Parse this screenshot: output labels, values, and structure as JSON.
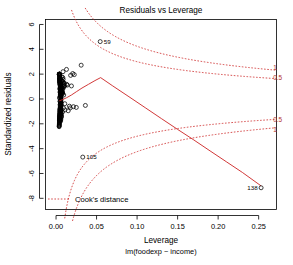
{
  "chart_data": {
    "type": "scatter",
    "title": "Residuals vs Leverage",
    "xlabel": "Leverage",
    "xsublabel": "lm(foodexp ~ income)",
    "ylabel": "Standardized residuals",
    "xlim": [
      -0.013,
      0.272
    ],
    "ylim": [
      -8.9,
      6.4
    ],
    "xticks": [
      "0.00",
      "0.05",
      "0.10",
      "0.15",
      "0.20",
      "0.25"
    ],
    "xtick_values": [
      0.0,
      0.05,
      0.1,
      0.15,
      0.2,
      0.25
    ],
    "yticks": [
      "6",
      "4",
      "2",
      "0",
      "-2",
      "-4",
      "-6",
      "-8"
    ],
    "ytick_values": [
      6,
      4,
      2,
      0,
      -2,
      -4,
      -6,
      -8
    ],
    "grid": false,
    "legend_position": "bottom-left",
    "point_marker": "open-circle",
    "series": [
      {
        "name": "observations",
        "x": [
          0.0362,
          0.0051,
          0.0079,
          0.0063,
          0.0057,
          0.0055,
          0.0129,
          0.0206,
          0.0046,
          0.008,
          0.031,
          0.0053,
          0.018,
          0.0092,
          0.0043,
          0.0058,
          0.0061,
          0.0049,
          0.0072,
          0.0225,
          0.0047,
          0.0054,
          0.0066,
          0.01,
          0.0042,
          0.0059,
          0.0086,
          0.0048,
          0.0051,
          0.014,
          0.0044,
          0.0063,
          0.0075,
          0.0052,
          0.0046,
          0.019,
          0.0057,
          0.0049,
          0.0068,
          0.0111,
          0.0044,
          0.006,
          0.0082,
          0.0047,
          0.0053,
          0.025,
          0.0045,
          0.0064,
          0.0071,
          0.0095,
          0.0043,
          0.0056,
          0.0088,
          0.005,
          0.0055,
          0.0165,
          0.0046,
          0.0062,
          0.0078,
          0.0105,
          0.0042,
          0.0058,
          0.0084,
          0.0051,
          0.0054,
          0.0215,
          0.0047,
          0.0065,
          0.0074,
          0.0098,
          0.0044,
          0.0057,
          0.009,
          0.0049,
          0.0052,
          0.015,
          0.0045,
          0.0061,
          0.0077,
          0.0102,
          0.0043,
          0.0059,
          0.0085,
          0.0048,
          0.0056,
          0.0175,
          0.0046,
          0.0063,
          0.0073,
          0.0093,
          0.0042,
          0.006,
          0.0087,
          0.005,
          0.0053,
          0.013,
          0.0047,
          0.0066,
          0.0076,
          0.0108
        ],
        "y": [
          -0.52,
          1.15,
          0.42,
          -1.3,
          0.88,
          -0.35,
          2.38,
          2.05,
          1.62,
          -1.05,
          2.72,
          0.25,
          1.9,
          -0.72,
          1.42,
          -1.58,
          0.62,
          -0.18,
          1.78,
          1.96,
          -0.92,
          0.35,
          -1.42,
          1.25,
          0.08,
          -1.68,
          2.2,
          0.55,
          -0.65,
          1.12,
          1.35,
          -1.22,
          0.72,
          -0.42,
          1.52,
          1.05,
          -1.78,
          0.18,
          0.95,
          -0.88,
          1.68,
          -0.28,
          0.48,
          -1.5,
          1.22,
          -0.68,
          0.82,
          -1.12,
          1.45,
          0.32,
          -1.62,
          0.92,
          1.58,
          -0.48,
          0.68,
          -0.58,
          1.32,
          -1.35,
          0.52,
          1.08,
          -1.72,
          0.78,
          1.72,
          -0.22,
          0.38,
          -0.62,
          1.18,
          -1.45,
          0.88,
          1.28,
          -1.55,
          0.45,
          0.98,
          -0.78,
          1.48,
          -0.95,
          1.62,
          -0.32,
          0.58,
          1.02,
          -1.65,
          0.65,
          1.38,
          -1.18,
          0.28,
          -0.72,
          1.55,
          -0.52,
          0.75,
          1.15,
          -1.38,
          0.42,
          0.85,
          -1.28,
          1.65,
          1.18,
          -0.85,
          0.52,
          1.42,
          -0.38
        ]
      }
    ],
    "labeled_points": [
      {
        "label": "59",
        "x": 0.0545,
        "y": 4.62,
        "label_side": "right"
      },
      {
        "label": "105",
        "x": 0.033,
        "y": -4.68,
        "label_side": "right"
      },
      {
        "label": "138",
        "x": 0.253,
        "y": -7.15,
        "label_side": "left"
      }
    ],
    "smoother": {
      "name": "loess-smooth",
      "color": "#cc2222",
      "points": [
        [
          0.004,
          -0.15
        ],
        [
          0.008,
          -0.05
        ],
        [
          0.013,
          0.1
        ],
        [
          0.019,
          0.32
        ],
        [
          0.025,
          0.58
        ],
        [
          0.032,
          0.88
        ],
        [
          0.04,
          1.18
        ],
        [
          0.048,
          1.48
        ],
        [
          0.055,
          1.72
        ],
        [
          0.07,
          1.05
        ],
        [
          0.09,
          0.18
        ],
        [
          0.11,
          -0.7
        ],
        [
          0.13,
          -1.58
        ],
        [
          0.15,
          -2.45
        ],
        [
          0.17,
          -3.3
        ],
        [
          0.19,
          -4.18
        ],
        [
          0.21,
          -5.05
        ],
        [
          0.23,
          -5.92
        ],
        [
          0.253,
          -7.0
        ]
      ]
    },
    "cook_contours": [
      {
        "level": "1",
        "sign": "positive",
        "label_x": 0.268,
        "label_y": 2.48
      },
      {
        "level": "0.5",
        "sign": "positive",
        "label_x": 0.268,
        "label_y": 1.72
      },
      {
        "level": "0.5",
        "sign": "negative",
        "label_x": 0.268,
        "label_y": -1.72
      },
      {
        "level": "1",
        "sign": "negative",
        "label_x": 0.268,
        "label_y": -2.48
      }
    ],
    "annotations": [
      {
        "name": "cooks-distance-legend",
        "text": "Cook's distance"
      }
    ]
  },
  "legend": {
    "cooks_distance_label": "Cook's distance"
  },
  "colors": {
    "smoother": "#cc2222",
    "contour": "#cc2222",
    "point": "#000000",
    "axis": "#000000",
    "background": "#ffffff"
  }
}
